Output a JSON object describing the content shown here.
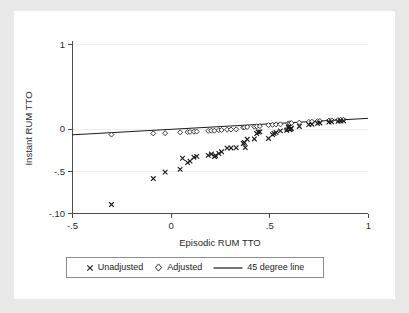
{
  "chart_data": {
    "type": "scatter",
    "title": "",
    "xlabel": "Episodic RUM TTO",
    "ylabel": "Instant RUM TTO",
    "xlim": [
      -0.5,
      1.0
    ],
    "ylim": [
      -1.0,
      1.0
    ],
    "xticks": [
      -0.5,
      0,
      0.5,
      1
    ],
    "xticklabels": [
      "-.5",
      "0",
      ".5",
      "1"
    ],
    "yticks": [
      1,
      0,
      -0.5,
      -1.0
    ],
    "yticklabels": [
      "1",
      "0",
      "-.5",
      "-.10"
    ],
    "grid": "horizontal",
    "legend_position": "below-axis",
    "series": [
      {
        "name": "Unadjusted",
        "marker": "x",
        "points": [
          [
            -0.3,
            -0.9
          ],
          [
            -0.088,
            -0.592
          ],
          [
            -0.028,
            -0.516
          ],
          [
            0.048,
            -0.484
          ],
          [
            0.06,
            -0.352
          ],
          [
            0.086,
            -0.404
          ],
          [
            0.098,
            -0.386
          ],
          [
            0.118,
            -0.34
          ],
          [
            0.132,
            -0.33
          ],
          [
            0.19,
            -0.318
          ],
          [
            0.206,
            -0.302
          ],
          [
            0.222,
            -0.332
          ],
          [
            0.228,
            -0.322
          ],
          [
            0.244,
            -0.296
          ],
          [
            0.258,
            -0.276
          ],
          [
            0.286,
            -0.232
          ],
          [
            0.306,
            -0.23
          ],
          [
            0.332,
            -0.228
          ],
          [
            0.378,
            -0.226
          ],
          [
            0.368,
            -0.178
          ],
          [
            0.374,
            -0.166
          ],
          [
            0.388,
            -0.128
          ],
          [
            0.424,
            -0.124
          ],
          [
            0.436,
            -0.06
          ],
          [
            0.444,
            -0.042
          ],
          [
            0.452,
            -0.04
          ],
          [
            0.496,
            -0.118
          ],
          [
            0.516,
            -0.072
          ],
          [
            0.524,
            -0.06
          ],
          [
            0.534,
            -0.048
          ],
          [
            0.556,
            -0.028
          ],
          [
            0.588,
            -0.02
          ],
          [
            0.596,
            0.012
          ],
          [
            0.6,
            0.02
          ],
          [
            0.604,
            -0.014
          ],
          [
            0.608,
            -0.006
          ],
          [
            0.612,
            0.002
          ],
          [
            0.652,
            0.024
          ],
          [
            0.7,
            0.046
          ],
          [
            0.716,
            0.05
          ],
          [
            0.744,
            0.062
          ],
          [
            0.756,
            0.066
          ],
          [
            0.802,
            0.076
          ],
          [
            0.816,
            0.08
          ],
          [
            0.848,
            0.084
          ],
          [
            0.862,
            0.088
          ],
          [
            0.876,
            0.09
          ]
        ]
      },
      {
        "name": "Adjusted",
        "marker": "diamond",
        "points": [
          [
            -0.3,
            -0.072
          ],
          [
            -0.088,
            -0.058
          ],
          [
            -0.028,
            -0.056
          ],
          [
            0.048,
            -0.046
          ],
          [
            0.086,
            -0.042
          ],
          [
            0.098,
            -0.04
          ],
          [
            0.118,
            -0.038
          ],
          [
            0.132,
            -0.036
          ],
          [
            0.19,
            -0.028
          ],
          [
            0.206,
            -0.026
          ],
          [
            0.222,
            -0.026
          ],
          [
            0.244,
            -0.02
          ],
          [
            0.258,
            -0.018
          ],
          [
            0.286,
            -0.014
          ],
          [
            0.306,
            -0.012
          ],
          [
            0.332,
            -0.01
          ],
          [
            0.368,
            0.012
          ],
          [
            0.374,
            0.014
          ],
          [
            0.388,
            0.018
          ],
          [
            0.424,
            0.022
          ],
          [
            0.436,
            0.026
          ],
          [
            0.452,
            0.028
          ],
          [
            0.496,
            0.04
          ],
          [
            0.516,
            0.044
          ],
          [
            0.534,
            0.048
          ],
          [
            0.556,
            0.05
          ],
          [
            0.588,
            -0.01
          ],
          [
            0.596,
            0.06
          ],
          [
            0.604,
            0.062
          ],
          [
            0.612,
            0.064
          ],
          [
            0.652,
            0.07
          ],
          [
            0.7,
            0.078
          ],
          [
            0.716,
            0.08
          ],
          [
            0.744,
            0.086
          ],
          [
            0.756,
            0.088
          ],
          [
            0.802,
            0.094
          ],
          [
            0.816,
            0.096
          ],
          [
            0.848,
            0.1
          ],
          [
            0.862,
            0.102
          ],
          [
            0.876,
            0.104
          ]
        ]
      },
      {
        "name": "45 degree line",
        "marker": "line",
        "points": [
          [
            -0.5,
            -0.075
          ],
          [
            1.0,
            0.12
          ]
        ]
      }
    ]
  },
  "legend": {
    "entries": [
      {
        "glyph": "x-marker-icon",
        "label": "Unadjusted"
      },
      {
        "glyph": "diamond-marker-icon",
        "label": "Adjusted"
      },
      {
        "glyph": "line-sample-icon",
        "label": "45 degree line"
      }
    ]
  }
}
